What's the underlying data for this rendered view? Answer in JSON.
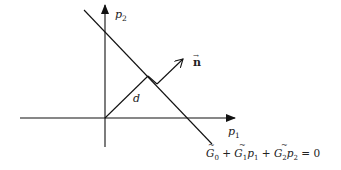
{
  "diagram": {
    "type": "geometry",
    "axes": {
      "x_label": "p",
      "x_sub": "1",
      "y_label": "p",
      "y_sub": "2"
    },
    "normal_vector": {
      "label": "n",
      "accent": "→"
    },
    "distance_label": "d",
    "line_equation": {
      "t0": "G",
      "s0": "0",
      "plus1": " + ",
      "t1": "G",
      "s1": "1",
      "v1": "p",
      "vs1": "1",
      "plus2": " + ",
      "t2": "G",
      "s2": "2",
      "v2": "p",
      "vs2": "2",
      "rhs": " = 0",
      "full_text": "G̃0 + G̃1p1 + G̃2p2 = 0"
    },
    "colors": {
      "stroke": "#111111",
      "background": "#ffffff"
    }
  }
}
